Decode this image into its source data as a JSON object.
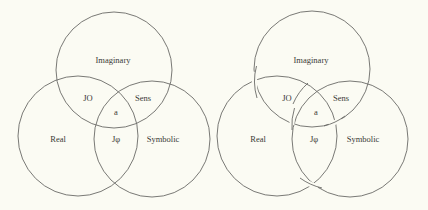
{
  "figure": {
    "background": "#fbfbf3",
    "stroke_color": "#6a6a66",
    "left_diagram": {
      "style": "venn-overlap",
      "circles": [
        {
          "name": "Imaginary",
          "cx": 114,
          "cy": 70,
          "r": 58
        },
        {
          "name": "Real",
          "cx": 78,
          "cy": 136,
          "r": 60
        },
        {
          "name": "Symbolic",
          "cx": 152,
          "cy": 139,
          "r": 58
        }
      ],
      "labels": {
        "imaginary": "Imaginary",
        "real": "Real",
        "symbolic": "Symbolic",
        "real_imaginary": "JO",
        "imaginary_symbolic": "Sens",
        "real_symbolic": "Jφ",
        "center": "a"
      }
    },
    "right_diagram": {
      "style": "borromean-knot",
      "circles": [
        {
          "name": "Imaginary",
          "cx": 312,
          "cy": 69,
          "r": 58
        },
        {
          "name": "Real",
          "cx": 277,
          "cy": 136,
          "r": 60
        },
        {
          "name": "Symbolic",
          "cx": 350,
          "cy": 139,
          "r": 58
        }
      ],
      "labels": {
        "imaginary": "Imaginary",
        "real": "Real",
        "symbolic": "Symbolic",
        "real_imaginary": "JO",
        "imaginary_symbolic": "Sens",
        "real_symbolic": "Jφ",
        "center": "a"
      }
    }
  }
}
